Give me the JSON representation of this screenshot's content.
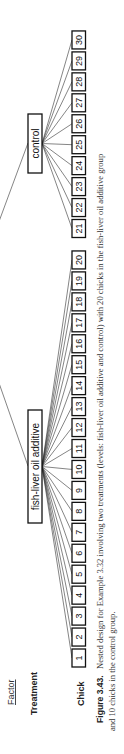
{
  "figure": {
    "factor_header": "Factor",
    "levels": {
      "treatment_label": "Treatment",
      "chick_label": "Chick"
    },
    "treatments": [
      {
        "name": "fish-liver oil additive",
        "chicks": [
          1,
          2,
          3,
          4,
          5,
          6,
          7,
          8,
          9,
          10,
          11,
          12,
          13,
          14,
          15,
          16,
          17,
          18,
          19,
          20
        ]
      },
      {
        "name": "control",
        "chicks": [
          21,
          22,
          23,
          24,
          25,
          26,
          27,
          28,
          29,
          30
        ]
      }
    ],
    "caption": {
      "label": "Figure 3.43.",
      "line1": "Nested design for Example 3.32 involving two treatments (levels: fish-liver oil additive and control) with 20 chicks in the fish-liver oil additive group",
      "line2": "and 10 chicks in the control group."
    },
    "colors": {
      "stroke": "#111111",
      "background": "#ffffff"
    }
  }
}
